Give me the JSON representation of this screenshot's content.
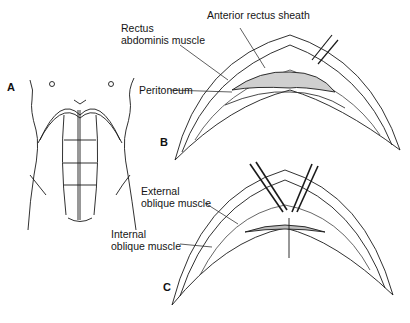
{
  "figure": {
    "panels": [
      {
        "id": "A",
        "label": "A",
        "description": "Anterior view of torso showing abdominal musculature"
      },
      {
        "id": "B",
        "label": "B",
        "description": "Transverse incision through anterior rectus sheath"
      },
      {
        "id": "C",
        "label": "C",
        "description": "Retractors spreading external and internal oblique muscles"
      }
    ],
    "labels": {
      "rectus_line1": "Rectus",
      "rectus_line2": "abdominis muscle",
      "anterior_rectus_sheath": "Anterior rectus sheath",
      "peritoneum": "Peritoneum",
      "external_line1": "External",
      "external_line2": "oblique muscle",
      "internal_line1": "Internal",
      "internal_line2": "oblique muscle"
    },
    "colors": {
      "ink": "#1a1a1a",
      "shade": "#8a8a8a",
      "background": "#ffffff"
    }
  }
}
